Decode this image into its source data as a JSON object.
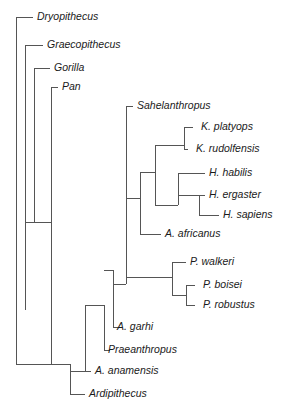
{
  "figure": {
    "type": "cladogram",
    "title": "",
    "orientation": "left-to-right",
    "background_color": "#ffffff",
    "line_color": "#555555",
    "text_color": "#1a1a1a"
  },
  "taxa": [
    {
      "id": "dryopithecus",
      "label": "Dryopithecus",
      "tip_x": 33,
      "tip_y": 17,
      "label_x": 37,
      "label_y": 17
    },
    {
      "id": "graecopithecus",
      "label": "Graecopithecus",
      "tip_x": 43,
      "tip_y": 45,
      "label_x": 47,
      "label_y": 45
    },
    {
      "id": "gorilla",
      "label": "Gorilla",
      "tip_x": 50,
      "tip_y": 68,
      "label_x": 54,
      "label_y": 68
    },
    {
      "id": "pan",
      "label": "Pan",
      "tip_x": 58,
      "tip_y": 87,
      "label_x": 62,
      "label_y": 87
    },
    {
      "id": "sahelanthropus",
      "label": "Sahelanthropus",
      "tip_x": 133,
      "tip_y": 106,
      "label_x": 137,
      "label_y": 106
    },
    {
      "id": "k-platyops",
      "label": "K. platyops",
      "tip_x": 197,
      "tip_y": 127,
      "label_x": 201,
      "label_y": 127
    },
    {
      "id": "k-rudolfensis",
      "label": "K. rudolfensis",
      "tip_x": 192,
      "tip_y": 149,
      "label_x": 196,
      "label_y": 149
    },
    {
      "id": "h-habilis",
      "label": "H. habilis",
      "tip_x": 205,
      "tip_y": 173,
      "label_x": 209,
      "label_y": 173
    },
    {
      "id": "h-ergaster",
      "label": "H. ergaster",
      "tip_x": 205,
      "tip_y": 195,
      "label_x": 209,
      "label_y": 195
    },
    {
      "id": "h-sapiens",
      "label": "H. sapiens",
      "tip_x": 219,
      "tip_y": 215,
      "label_x": 223,
      "label_y": 215
    },
    {
      "id": "a-africanus",
      "label": "A. africanus",
      "tip_x": 161,
      "tip_y": 234,
      "label_x": 165,
      "label_y": 234
    },
    {
      "id": "p-walkeri",
      "label": "P. walkeri",
      "tip_x": 186,
      "tip_y": 262,
      "label_x": 190,
      "label_y": 262
    },
    {
      "id": "p-boisei",
      "label": "P. boisei",
      "tip_x": 199,
      "tip_y": 285,
      "label_x": 203,
      "label_y": 285
    },
    {
      "id": "p-robustus",
      "label": "P. robustus",
      "tip_x": 199,
      "tip_y": 305,
      "label_x": 203,
      "label_y": 305
    },
    {
      "id": "a-garhi",
      "label": "A. garhi",
      "tip_x": 113,
      "tip_y": 327,
      "label_x": 117,
      "label_y": 327
    },
    {
      "id": "praeanthropus",
      "label": "Praeanthropus",
      "tip_x": 104,
      "tip_y": 350,
      "label_x": 108,
      "label_y": 350
    },
    {
      "id": "a-anamensis",
      "label": "A. anamensis",
      "tip_x": 91,
      "tip_y": 371,
      "label_x": 95,
      "label_y": 371
    },
    {
      "id": "ardipithecus",
      "label": "Ardipithecus",
      "tip_x": 85,
      "tip_y": 394,
      "label_x": 89,
      "label_y": 394
    }
  ],
  "nodes": [
    {
      "id": "root",
      "x": 16,
      "y_top": 17,
      "y_bottom": 310,
      "stub_to": 53,
      "stub_y": 364
    },
    {
      "id": "node-great-apes",
      "x": 25,
      "y_top": 45,
      "y_bottom": 310
    },
    {
      "id": "node-gorilla",
      "x": 34,
      "y_top": 68,
      "y_bottom": 222
    },
    {
      "id": "node-pan",
      "x": 51,
      "y_top": 87,
      "y_bottom": 364
    },
    {
      "id": "node-hominin",
      "x": 70,
      "y_top": 364,
      "y_bottom": 394
    },
    {
      "id": "node-ardi",
      "x": 85,
      "y_top": 371,
      "y_bottom": 394
    },
    {
      "id": "node-anam",
      "x": 85,
      "y_top": 305,
      "y_bottom": 371
    },
    {
      "id": "node-praean",
      "x": 104,
      "y_top": 305,
      "y_bottom": 350
    },
    {
      "id": "node-garhi",
      "x": 113,
      "y_top": 270,
      "y_bottom": 327
    },
    {
      "id": "node-crown",
      "x": 113,
      "y_top": 234,
      "y_bottom": 284
    },
    {
      "id": "node-sahel",
      "x": 126,
      "y_top": 106,
      "y_bottom": 198
    },
    {
      "id": "node-africanus",
      "x": 140,
      "y_top": 172,
      "y_bottom": 234
    },
    {
      "id": "node-kenya-homo",
      "x": 155,
      "y_top": 145,
      "y_bottom": 205
    },
    {
      "id": "node-kenyanthr",
      "x": 184,
      "y_top": 127,
      "y_bottom": 149
    },
    {
      "id": "node-homo",
      "x": 178,
      "y_top": 173,
      "y_bottom": 205
    },
    {
      "id": "node-erg-sap",
      "x": 199,
      "y_top": 195,
      "y_bottom": 215
    },
    {
      "id": "node-paranth",
      "x": 172,
      "y_top": 262,
      "y_bottom": 295
    },
    {
      "id": "node-boi-rob",
      "x": 186,
      "y_top": 285,
      "y_bottom": 305
    }
  ],
  "branches": {
    "description": "Rectangular cladogram branch segments in SVG path form (horizontal tip leads and vertical node spines).",
    "segments": [
      {
        "name": "root-spine",
        "d": "M16,17 L16,310"
      },
      {
        "name": "root-stub",
        "d": "M16,310 L16,364 L53,364"
      },
      {
        "name": "dryopithecus-lead",
        "d": "M16,17 L33,17"
      },
      {
        "name": "greatape-spine",
        "d": "M25,45 L25,310"
      },
      {
        "name": "graecopithecus-lead",
        "d": "M25,45 L43,45"
      },
      {
        "name": "gorilla-spine",
        "d": "M34,68 L34,222"
      },
      {
        "name": "gorilla-lead",
        "d": "M34,68 L50,68"
      },
      {
        "name": "gorilla-node-join",
        "d": "M25,222 L34,222"
      },
      {
        "name": "pan-spine",
        "d": "M51,87 L51,364"
      },
      {
        "name": "pan-lead",
        "d": "M51,87 L58,87"
      },
      {
        "name": "pan-node-join",
        "d": "M34,222 L51,222"
      },
      {
        "name": "hominin-root-h",
        "d": "M51,364 L70,364"
      },
      {
        "name": "hominin-spine",
        "d": "M70,364 L70,394"
      },
      {
        "name": "ardipithecus-lead",
        "d": "M70,394 L85,394"
      },
      {
        "name": "anam-spine",
        "d": "M85,305 L85,371"
      },
      {
        "name": "anamensis-lead",
        "d": "M85,371 L91,371"
      },
      {
        "name": "anam-join",
        "d": "M70,371 L85,371"
      },
      {
        "name": "praean-spine",
        "d": "M104,305 L104,350"
      },
      {
        "name": "praeanthropus-lead",
        "d": "M104,350 L110,350"
      },
      {
        "name": "praean-join",
        "d": "M85,305 L104,305"
      },
      {
        "name": "garhi-spine",
        "d": "M113,270 L113,327"
      },
      {
        "name": "garhi-lead",
        "d": "M113,327 L119,327"
      },
      {
        "name": "garhi-join",
        "d": "M104,270 L113,270"
      },
      {
        "name": "crown-spine",
        "d": "M126,198 L126,284"
      },
      {
        "name": "crown-join",
        "d": "M113,284 L126,284"
      },
      {
        "name": "sahelanthropus-spine",
        "d": "M126,106 L126,198"
      },
      {
        "name": "sahelanthropus-lead",
        "d": "M126,106 L133,106"
      },
      {
        "name": "africanus-spine",
        "d": "M140,172 L140,234"
      },
      {
        "name": "africanus-lead",
        "d": "M140,234 L161,234"
      },
      {
        "name": "africanus-join",
        "d": "M126,198 L140,198"
      },
      {
        "name": "kenyahomo-spine",
        "d": "M155,145 L155,205"
      },
      {
        "name": "kenyahomo-join",
        "d": "M140,172 L155,172"
      },
      {
        "name": "kenyanthropus-spine",
        "d": "M184,127 L184,149"
      },
      {
        "name": "kenyanthropus-join",
        "d": "M155,145 L184,145"
      },
      {
        "name": "k-platyops-lead",
        "d": "M184,127 L193,127"
      },
      {
        "name": "k-rudolfensis-lead",
        "d": "M184,149 L188,149"
      },
      {
        "name": "homo-spine",
        "d": "M178,173 L178,205"
      },
      {
        "name": "homo-join",
        "d": "M155,205 L178,205"
      },
      {
        "name": "h-habilis-lead",
        "d": "M178,173 L205,173"
      },
      {
        "name": "erg-sap-spine",
        "d": "M199,195 L199,215"
      },
      {
        "name": "erg-sap-join",
        "d": "M178,195 L199,195"
      },
      {
        "name": "h-ergaster-lead",
        "d": "M199,195 L205,195"
      },
      {
        "name": "h-sapiens-lead",
        "d": "M199,215 L219,215"
      },
      {
        "name": "paranthropus-spine",
        "d": "M172,262 L172,295"
      },
      {
        "name": "paranthropus-join",
        "d": "M126,277 L172,277"
      },
      {
        "name": "p-walkeri-lead",
        "d": "M172,262 L186,262"
      },
      {
        "name": "boi-rob-spine",
        "d": "M186,285 L186,305"
      },
      {
        "name": "boi-rob-join",
        "d": "M172,295 L186,295"
      },
      {
        "name": "p-boisei-lead",
        "d": "M186,285 L195,285"
      },
      {
        "name": "p-robustus-lead",
        "d": "M186,305 L195,305"
      }
    ]
  }
}
